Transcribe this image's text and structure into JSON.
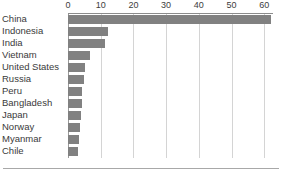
{
  "chart_data": {
    "type": "bar",
    "orientation": "horizontal",
    "title": "",
    "subtitle": "",
    "xlabel": "",
    "ylabel": "",
    "xlim": [
      0,
      64.5
    ],
    "grid": true,
    "legend": null,
    "axis_position": "top",
    "bar_color": "#818181",
    "gridline_color": "#d4d4d4",
    "axis_line_color": "#8c8c8c",
    "tick_values": [
      0,
      10,
      20,
      30,
      40,
      50,
      60
    ],
    "tick_labels": [
      "0",
      "10",
      "20",
      "30",
      "40",
      "50",
      "60"
    ],
    "categories": [
      "China",
      "Indonesia",
      "India",
      "Vietnam",
      "United States",
      "Russia",
      "Peru",
      "Bangladesh",
      "Japan",
      "Norway",
      "Myanmar",
      "Chile"
    ],
    "values": [
      62,
      12.3,
      11.2,
      6.6,
      5.2,
      4.9,
      4.4,
      4.3,
      3.9,
      3.8,
      3.4,
      3.2
    ]
  }
}
